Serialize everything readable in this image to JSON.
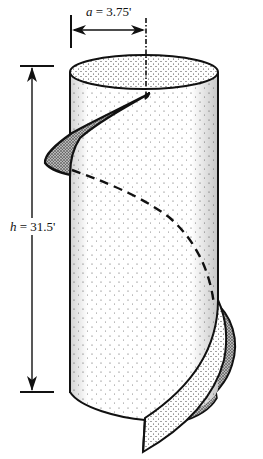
{
  "diagram": {
    "labels": {
      "radius": {
        "var": "a",
        "eq": " = ",
        "value": "3.75'"
      },
      "height": {
        "var": "h",
        "eq": " = ",
        "value": "31.5'"
      }
    },
    "colors": {
      "ink": "#111111",
      "background": "#ffffff",
      "stipple": "#444444"
    }
  }
}
